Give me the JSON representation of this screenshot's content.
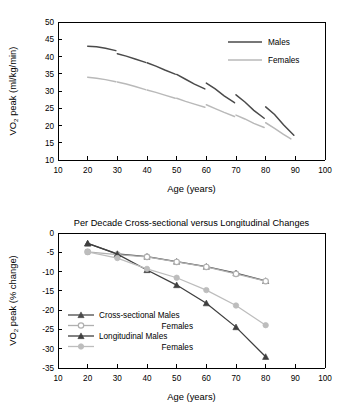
{
  "figure": {
    "background": "#ffffff",
    "colors": {
      "males": "#4a4a4a",
      "females": "#b9b9b9",
      "axis": "#000000",
      "cross_males": "#4a4a4a",
      "cross_females": "#b0b0b0",
      "long_males": "#3f3f3f",
      "long_females": "#bdbdbd"
    }
  },
  "chart_data": [
    {
      "type": "line",
      "id": "vo2peak-absolute",
      "title": "",
      "xlabel": "Age (years)",
      "ylabel": "VO2 peak (ml/kg/min)",
      "ylabel_parts": {
        "pre": "VO",
        "sub": "2",
        "post": " peak (ml/kg/min)"
      },
      "xlim": [
        10,
        100
      ],
      "ylim": [
        10,
        50
      ],
      "xticks": [
        10,
        20,
        30,
        40,
        50,
        60,
        70,
        80,
        90,
        100
      ],
      "yticks": [
        10,
        15,
        20,
        25,
        30,
        35,
        40,
        45,
        50
      ],
      "grid": false,
      "legend_position": "top-right",
      "legend": [
        "Males",
        "Females"
      ],
      "note": "Each series is drawn as eight separate per-decade cohort segments (longitudinal follow-up), leaving visible gaps between decades.",
      "series": [
        {
          "name": "Males",
          "color": "#4a4a4a",
          "segments": [
            {
              "cohort": "20s",
              "x": [
                20,
                23,
                26,
                29.5
              ],
              "y": [
                43.0,
                42.8,
                42.4,
                41.7
              ]
            },
            {
              "cohort": "30s",
              "x": [
                30,
                33,
                36,
                39.5
              ],
              "y": [
                40.8,
                40.1,
                39.3,
                38.3
              ]
            },
            {
              "cohort": "40s",
              "x": [
                40,
                43,
                46,
                49.5
              ],
              "y": [
                38.2,
                37.2,
                36.1,
                34.9
              ]
            },
            {
              "cohort": "50s",
              "x": [
                50,
                53,
                56,
                59.5
              ],
              "y": [
                34.8,
                33.4,
                32.0,
                30.6
              ]
            },
            {
              "cohort": "60s",
              "x": [
                60,
                63,
                66,
                69.5
              ],
              "y": [
                32.3,
                30.6,
                28.6,
                26.6
              ]
            },
            {
              "cohort": "70s",
              "x": [
                70,
                73,
                76,
                79.5
              ],
              "y": [
                28.9,
                26.8,
                24.4,
                22.1
              ]
            },
            {
              "cohort": "80s",
              "x": [
                80,
                83,
                86,
                89.5
              ],
              "y": [
                25.4,
                23.2,
                20.2,
                17.2
              ]
            }
          ]
        },
        {
          "name": "Females",
          "color": "#b9b9b9",
          "segments": [
            {
              "cohort": "20s",
              "x": [
                20,
                23,
                26,
                29.5
              ],
              "y": [
                34.0,
                33.7,
                33.3,
                32.7
              ]
            },
            {
              "cohort": "30s",
              "x": [
                30,
                33,
                36,
                39.5
              ],
              "y": [
                32.6,
                32.0,
                31.3,
                30.4
              ]
            },
            {
              "cohort": "40s",
              "x": [
                40,
                43,
                46,
                49.5
              ],
              "y": [
                30.3,
                29.6,
                28.8,
                27.9
              ]
            },
            {
              "cohort": "50s",
              "x": [
                50,
                53,
                56,
                59.5
              ],
              "y": [
                27.9,
                27.0,
                26.2,
                25.3
              ]
            },
            {
              "cohort": "60s",
              "x": [
                60,
                63,
                66,
                69.5
              ],
              "y": [
                26.0,
                24.9,
                23.8,
                22.6
              ]
            },
            {
              "cohort": "70s",
              "x": [
                70,
                73,
                76,
                79.5
              ],
              "y": [
                23.0,
                21.9,
                20.6,
                19.4
              ]
            },
            {
              "cohort": "80s",
              "x": [
                80,
                83,
                86,
                88.5
              ],
              "y": [
                20.8,
                19.2,
                17.4,
                16.1
              ]
            }
          ]
        }
      ]
    },
    {
      "type": "line",
      "id": "vo2peak-percent-change",
      "title": "Per Decade Cross-sectional versus Longitudinal Changes",
      "xlabel": "Age (years)",
      "ylabel": "VO2 peak (% change)",
      "ylabel_parts": {
        "pre": "VO",
        "sub": "2",
        "post": " peak (% change)"
      },
      "xlim": [
        10,
        100
      ],
      "ylim": [
        -35,
        0
      ],
      "xticks": [
        10,
        20,
        30,
        40,
        50,
        60,
        70,
        80,
        90,
        100
      ],
      "yticks": [
        0,
        -5,
        -10,
        -15,
        -20,
        -25,
        -30,
        -35
      ],
      "grid": false,
      "legend_position": "center-left",
      "legend": [
        {
          "label": "Cross-sectional Males",
          "marker": "triangle-filled",
          "color": "#4a4a4a"
        },
        {
          "label": "Females",
          "marker": "circle-open",
          "color": "#b0b0b0",
          "align": "right"
        },
        {
          "label": "Longitudinal Males",
          "marker": "triangle-filled",
          "color": "#3f3f3f"
        },
        {
          "label": "Females",
          "marker": "circle-filled",
          "color": "#bdbdbd",
          "align": "right"
        }
      ],
      "categories": [
        20,
        30,
        40,
        50,
        60,
        70,
        80
      ],
      "series": [
        {
          "name": "Cross-sectional Males",
          "marker": "triangle-filled",
          "color": "#4a4a4a",
          "x": [
            20,
            30,
            40,
            50,
            60,
            70,
            80
          ],
          "values": [
            -2.7,
            -5.4,
            -6.1,
            -7.4,
            -8.7,
            -10.4,
            -12.4
          ]
        },
        {
          "name": "Cross-sectional Females",
          "marker": "circle-open",
          "color": "#b0b0b0",
          "x": [
            20,
            30,
            40,
            50,
            60,
            70,
            80
          ],
          "values": [
            -4.9,
            -5.6,
            -6.2,
            -7.5,
            -8.8,
            -10.6,
            -12.5
          ]
        },
        {
          "name": "Longitudinal Males",
          "marker": "triangle-filled",
          "color": "#3f3f3f",
          "x": [
            20,
            30,
            40,
            50,
            60,
            70,
            80
          ],
          "values": [
            -2.7,
            -5.5,
            -9.6,
            -13.5,
            -18.2,
            -24.4,
            -32.1
          ]
        },
        {
          "name": "Longitudinal Females",
          "marker": "circle-filled",
          "color": "#bdbdbd",
          "x": [
            20,
            30,
            40,
            50,
            60,
            70,
            80
          ],
          "values": [
            -4.9,
            -6.5,
            -9.3,
            -11.6,
            -14.8,
            -18.8,
            -23.9
          ]
        }
      ]
    }
  ]
}
